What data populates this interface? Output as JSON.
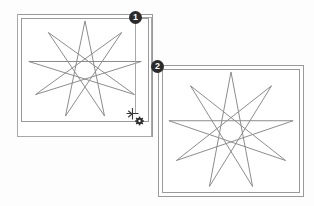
{
  "scene": {
    "background_color": "#fdfdfd",
    "stroke_color": "#8a8a8a",
    "frame_color": "#9a9a9a",
    "badge_color": "#2b2b2b",
    "badge_text_color": "#ffffff",
    "width": 314,
    "height": 206
  },
  "annotations": {
    "step_one_label": "1",
    "step_two_label": "2"
  },
  "panels": [
    {
      "id": "panel-one",
      "name": "drawing-window-before-resize",
      "badge": "1",
      "frame": {
        "x": 17,
        "y": 14,
        "width": 136,
        "height": 123
      },
      "canvas": {
        "x": 20,
        "y": 17,
        "width": 128,
        "height": 104
      },
      "shape": {
        "type": "star-polygon",
        "points": 9,
        "step": 4,
        "center_x": 64,
        "center_y": 52,
        "radius_x": 58,
        "radius_y": 50,
        "rotation_deg": -90,
        "stroke": "#8a8a8a",
        "stroke_width": 1
      }
    },
    {
      "id": "panel-two",
      "name": "drawing-window-after-resize",
      "badge": "2",
      "frame": {
        "x": 158,
        "y": 65,
        "width": 146,
        "height": 132
      },
      "canvas": {
        "x": 161,
        "y": 68,
        "width": 138,
        "height": 124
      },
      "shape": {
        "type": "star-polygon",
        "points": 9,
        "step": 4,
        "center_x": 69,
        "center_y": 62,
        "radius_x": 64,
        "radius_y": 60,
        "rotation_deg": -90,
        "stroke": "#8a8a8a",
        "stroke_width": 1
      }
    }
  ],
  "cursor": {
    "name": "resize-drag-cursor",
    "x": 126,
    "y": 108,
    "glyph": "move-resize-crosshair",
    "badge_glyph": "gear-icon"
  },
  "guides": {
    "connector_from_badge_one": {
      "x1": 135,
      "y1": 18,
      "x2": 135,
      "y2": 113
    },
    "connector_top": {
      "x1": 135,
      "y1": 18,
      "x2": 152,
      "y2": 18
    },
    "connector_right": {
      "x1": 152,
      "y1": 18,
      "x2": 152,
      "y2": 136
    }
  }
}
